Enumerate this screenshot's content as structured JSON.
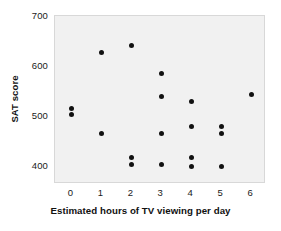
{
  "chart_data": {
    "type": "scatter",
    "title": "",
    "xlabel": "Estimated hours of TV viewing per day",
    "ylabel": "SAT score",
    "xlim": [
      -0.55,
      6.5
    ],
    "ylim": [
      365,
      700
    ],
    "xticks": [
      0,
      1,
      2,
      3,
      4,
      5,
      6
    ],
    "xtick_labels": [
      "0",
      "1",
      "2",
      "3",
      "4",
      "5",
      "6"
    ],
    "yticks": [
      400,
      500,
      600,
      700
    ],
    "ytick_labels": [
      "400",
      "500",
      "600",
      "700"
    ],
    "grid": false,
    "legend": null,
    "marker": {
      "shape": "circle",
      "color": "#111111",
      "size_px": 5
    },
    "plot_background": "#f1f1f1",
    "figure_background": "#ffffff",
    "points": [
      {
        "x": 0,
        "y": 515
      },
      {
        "x": 0,
        "y": 503
      },
      {
        "x": 1,
        "y": 628
      },
      {
        "x": 1,
        "y": 466
      },
      {
        "x": 2,
        "y": 642
      },
      {
        "x": 2,
        "y": 418
      },
      {
        "x": 2,
        "y": 403
      },
      {
        "x": 3,
        "y": 585
      },
      {
        "x": 3,
        "y": 540
      },
      {
        "x": 3,
        "y": 466
      },
      {
        "x": 3,
        "y": 403
      },
      {
        "x": 4,
        "y": 529
      },
      {
        "x": 4,
        "y": 480
      },
      {
        "x": 4,
        "y": 418
      },
      {
        "x": 4,
        "y": 400
      },
      {
        "x": 5,
        "y": 480
      },
      {
        "x": 5,
        "y": 466
      },
      {
        "x": 5,
        "y": 400
      },
      {
        "x": 6,
        "y": 543
      }
    ]
  }
}
